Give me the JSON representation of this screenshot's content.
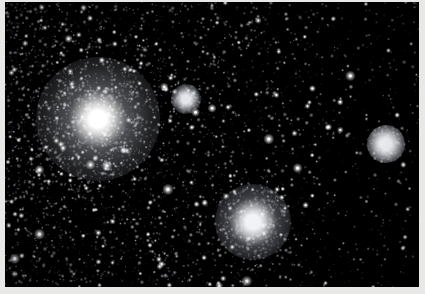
{
  "image": {
    "kind": "astrophotograph",
    "subject": "dense star field with globular clusters",
    "background_color": "#000000",
    "border_color": "#e8e8e6",
    "width": 425,
    "height": 294,
    "plate": {
      "x": 5,
      "y": 2,
      "width": 414,
      "height": 285
    }
  },
  "field": {
    "star_color_bright": "#ffffff",
    "star_color_mid": "#c8cbd4",
    "star_color_faint": "#6e7380",
    "nebulosity_color": "#969aa6",
    "density_note": "star density decreases strongly from left to right",
    "star_count": 4200,
    "density_gradient": {
      "left": 1.0,
      "right": 0.18
    }
  },
  "objects": [
    {
      "name": "main-globular-cluster",
      "cx": 98,
      "cy": 119,
      "core_radius": 11,
      "halo_radius": 62,
      "brightness": "very-bright",
      "core_color": "#ffffff",
      "halo_color": "#b9bcc6"
    },
    {
      "name": "lower-globular-cluster",
      "cx": 253,
      "cy": 222,
      "core_radius": 9,
      "halo_radius": 38,
      "brightness": "bright",
      "core_color": "#f2f3f6",
      "halo_color": "#989ca8"
    },
    {
      "name": "right-globular-cluster",
      "cx": 386,
      "cy": 144,
      "core_radius": 7,
      "halo_radius": 19,
      "brightness": "medium-bright",
      "core_color": "#eceef2",
      "halo_color": "#8a8f9b"
    },
    {
      "name": "upper-compact-cluster",
      "cx": 186,
      "cy": 99,
      "core_radius": 5,
      "halo_radius": 15,
      "brightness": "medium",
      "core_color": "#e4e6ec",
      "halo_color": "#7e838f"
    }
  ]
}
